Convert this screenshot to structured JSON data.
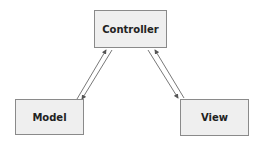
{
  "diagram": {
    "nodes": [
      {
        "id": "controller",
        "label": "Controller"
      },
      {
        "id": "model",
        "label": "Model"
      },
      {
        "id": "view",
        "label": "View"
      }
    ],
    "edges": [
      {
        "from": "model",
        "to": "controller"
      },
      {
        "from": "controller",
        "to": "model"
      },
      {
        "from": "controller",
        "to": "view"
      },
      {
        "from": "view",
        "to": "controller"
      }
    ],
    "colors": {
      "box_fill": "#efefef",
      "box_border": "#8a8a8a",
      "text": "#222222",
      "arrow": "#555555"
    }
  }
}
